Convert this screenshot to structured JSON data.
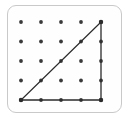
{
  "figure": {
    "board": {
      "label": "pin-grid-board",
      "rows": 5,
      "columns": 5,
      "pin_count": 25,
      "frame_color": "#c9c9c9",
      "background_color": "#fefefe",
      "pin_color": "#3a3a3a",
      "pin_radius": 1.9,
      "corner_radius": 9,
      "origin_x": 21,
      "origin_y": 22,
      "spacing_x": 20,
      "spacing_y": 19.5
    },
    "pins": [
      {
        "row": 0,
        "col": 0,
        "cx": 21,
        "cy": 22
      },
      {
        "row": 0,
        "col": 1,
        "cx": 41,
        "cy": 22
      },
      {
        "row": 0,
        "col": 2,
        "cx": 61,
        "cy": 22
      },
      {
        "row": 0,
        "col": 3,
        "cx": 81,
        "cy": 22
      },
      {
        "row": 0,
        "col": 4,
        "cx": 101,
        "cy": 22
      },
      {
        "row": 1,
        "col": 0,
        "cx": 21,
        "cy": 41.5
      },
      {
        "row": 1,
        "col": 1,
        "cx": 41,
        "cy": 41.5
      },
      {
        "row": 1,
        "col": 2,
        "cx": 61,
        "cy": 41.5
      },
      {
        "row": 1,
        "col": 3,
        "cx": 81,
        "cy": 41.5
      },
      {
        "row": 1,
        "col": 4,
        "cx": 101,
        "cy": 41.5
      },
      {
        "row": 2,
        "col": 0,
        "cx": 21,
        "cy": 61
      },
      {
        "row": 2,
        "col": 1,
        "cx": 41,
        "cy": 61
      },
      {
        "row": 2,
        "col": 2,
        "cx": 61,
        "cy": 61
      },
      {
        "row": 2,
        "col": 3,
        "cx": 81,
        "cy": 61
      },
      {
        "row": 2,
        "col": 4,
        "cx": 101,
        "cy": 61
      },
      {
        "row": 3,
        "col": 0,
        "cx": 21,
        "cy": 80.5
      },
      {
        "row": 3,
        "col": 1,
        "cx": 41,
        "cy": 80.5
      },
      {
        "row": 3,
        "col": 2,
        "cx": 61,
        "cy": 80.5
      },
      {
        "row": 3,
        "col": 3,
        "cx": 81,
        "cy": 80.5
      },
      {
        "row": 3,
        "col": 4,
        "cx": 101,
        "cy": 80.5
      },
      {
        "row": 4,
        "col": 0,
        "cx": 21,
        "cy": 100
      },
      {
        "row": 4,
        "col": 1,
        "cx": 41,
        "cy": 100
      },
      {
        "row": 4,
        "col": 2,
        "cx": 61,
        "cy": 100
      },
      {
        "row": 4,
        "col": 3,
        "cx": 81,
        "cy": 100
      },
      {
        "row": 4,
        "col": 4,
        "cx": 101,
        "cy": 100
      }
    ],
    "shape": {
      "name": "right-triangle",
      "stroke_color": "#2b2b2b",
      "stroke_width": 1.3,
      "fill": "none",
      "vertices": [
        {
          "label": "bottom-left",
          "row": 4,
          "col": 0,
          "x": 21,
          "y": 100
        },
        {
          "label": "bottom-right",
          "row": 4,
          "col": 4,
          "x": 101,
          "y": 100
        },
        {
          "label": "top-right",
          "row": 0,
          "col": 4,
          "x": 101,
          "y": 22
        }
      ],
      "polygon_points": "21,100 101,100 101,22",
      "edges": [
        {
          "name": "horizontal-leg",
          "from": "bottom-left",
          "to": "bottom-right"
        },
        {
          "name": "vertical-leg",
          "from": "bottom-right",
          "to": "top-right"
        },
        {
          "name": "hypotenuse",
          "from": "top-right",
          "to": "bottom-left"
        }
      ]
    }
  }
}
